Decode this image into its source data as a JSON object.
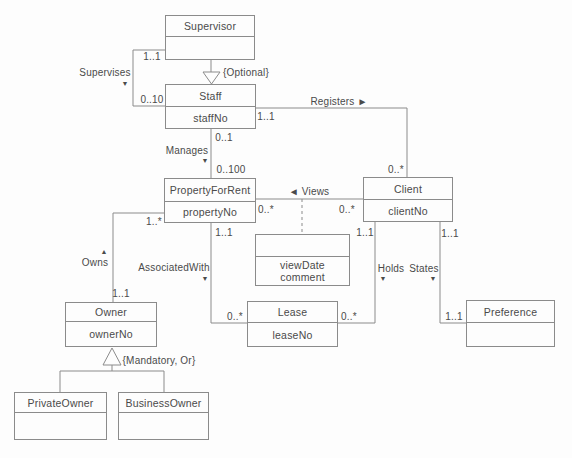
{
  "diagram": {
    "colors": {
      "background": "#fdfdfd",
      "box_fill": "#fdfdfd",
      "line": "#8b8b8b",
      "text": "#4a4a4a"
    },
    "classes": [
      {
        "id": "supervisor",
        "name": "Supervisor",
        "attributes": [],
        "x": 165,
        "y": 15,
        "w": 90,
        "h": 45,
        "divider_y": 37
      },
      {
        "id": "staff",
        "name": "Staff",
        "attributes": [
          "staffNo"
        ],
        "x": 165,
        "y": 84,
        "w": 91,
        "h": 45,
        "divider_y": 107
      },
      {
        "id": "property-for-rent",
        "name": "PropertyForRent",
        "attributes": [
          "propertyNo"
        ],
        "x": 164,
        "y": 178,
        "w": 92,
        "h": 45,
        "divider_y": 202
      },
      {
        "id": "client",
        "name": "Client",
        "attributes": [
          "clientNo"
        ],
        "x": 363,
        "y": 177,
        "w": 90,
        "h": 45,
        "divider_y": 200
      },
      {
        "id": "viewing",
        "name": "",
        "attributes": [
          "viewDate",
          "comment"
        ],
        "x": 255,
        "y": 234,
        "w": 95,
        "h": 52,
        "divider_y": 257
      },
      {
        "id": "owner",
        "name": "Owner",
        "attributes": [
          "ownerNo"
        ],
        "x": 65,
        "y": 302,
        "w": 92,
        "h": 45,
        "divider_y": 322
      },
      {
        "id": "lease",
        "name": "Lease",
        "attributes": [
          "leaseNo"
        ],
        "x": 247,
        "y": 301,
        "w": 91,
        "h": 46,
        "divider_y": 323
      },
      {
        "id": "preference",
        "name": "Preference",
        "attributes": [],
        "x": 466,
        "y": 300,
        "w": 89,
        "h": 47,
        "divider_y": 323
      },
      {
        "id": "private-owner",
        "name": "PrivateOwner",
        "attributes": [],
        "x": 14,
        "y": 392,
        "w": 93,
        "h": 48,
        "divider_y": 413
      },
      {
        "id": "business-owner",
        "name": "BusinessOwner",
        "attributes": [],
        "x": 118,
        "y": 392,
        "w": 91,
        "h": 48,
        "divider_y": 413
      }
    ],
    "edges": [
      {
        "id": "supervises-line",
        "points": [
          [
            165,
            50
          ],
          [
            133,
            50
          ],
          [
            133,
            106
          ],
          [
            165,
            106
          ]
        ],
        "dashed": false
      },
      {
        "id": "supervisor-generalization-stem",
        "points": [
          [
            211,
            60
          ],
          [
            211,
            72
          ]
        ],
        "dashed": false
      },
      {
        "id": "manages-line",
        "points": [
          [
            211,
            129
          ],
          [
            211,
            178
          ]
        ],
        "dashed": false
      },
      {
        "id": "registers-line",
        "points": [
          [
            256,
            108
          ],
          [
            407,
            108
          ],
          [
            407,
            177
          ]
        ],
        "dashed": false
      },
      {
        "id": "views-line",
        "points": [
          [
            256,
            199
          ],
          [
            363,
            199
          ]
        ],
        "dashed": false
      },
      {
        "id": "views-association-class-link",
        "points": [
          [
            302,
            199
          ],
          [
            302,
            234
          ]
        ],
        "dashed": true
      },
      {
        "id": "owns-line",
        "points": [
          [
            164,
            213
          ],
          [
            113,
            213
          ],
          [
            113,
            302
          ]
        ],
        "dashed": false
      },
      {
        "id": "associated-with-line",
        "points": [
          [
            211,
            223
          ],
          [
            211,
            323
          ],
          [
            247,
            323
          ]
        ],
        "dashed": false
      },
      {
        "id": "holds-line",
        "points": [
          [
            375,
            222
          ],
          [
            375,
            323
          ],
          [
            338,
            323
          ]
        ],
        "dashed": false
      },
      {
        "id": "states-line",
        "points": [
          [
            440,
            222
          ],
          [
            440,
            323
          ],
          [
            466,
            323
          ]
        ],
        "dashed": false
      },
      {
        "id": "owner-generalization-stem",
        "points": [
          [
            112,
            365
          ],
          [
            112,
            371
          ]
        ],
        "dashed": false
      },
      {
        "id": "owner-generalization-crossbar",
        "points": [
          [
            60,
            371
          ],
          [
            164,
            371
          ]
        ],
        "dashed": false
      },
      {
        "id": "owner-generalization-left-drop",
        "points": [
          [
            60,
            371
          ],
          [
            60,
            392
          ]
        ],
        "dashed": false
      },
      {
        "id": "owner-generalization-right-drop",
        "points": [
          [
            164,
            371
          ],
          [
            164,
            392
          ]
        ],
        "dashed": false
      }
    ],
    "generalization_triangles": [
      {
        "id": "staff-generalization-triangle",
        "points": [
          [
            203,
            72
          ],
          [
            220,
            72
          ],
          [
            211.5,
            84
          ]
        ]
      },
      {
        "id": "owner-generalization-triangle",
        "points": [
          [
            112,
            348
          ],
          [
            103,
            365
          ],
          [
            121,
            365
          ]
        ]
      }
    ],
    "labels": [
      {
        "id": "mult-supervises-supervisor",
        "text": "1..1",
        "x": 152,
        "y": 56,
        "size": 10
      },
      {
        "id": "assoc-supervises",
        "text": "Supervises",
        "x": 105,
        "y": 72,
        "size": 10
      },
      {
        "id": "arrow-supervises-down",
        "text": "▼",
        "x": 125,
        "y": 83,
        "size": 7
      },
      {
        "id": "mult-supervises-staff",
        "text": "0..10",
        "x": 152,
        "y": 99,
        "size": 10
      },
      {
        "id": "constraint-optional",
        "text": "{Optional}",
        "x": 246,
        "y": 72,
        "size": 10
      },
      {
        "id": "assoc-registers",
        "text": "Registers ►",
        "x": 339,
        "y": 101,
        "size": 10
      },
      {
        "id": "mult-registers-staff",
        "text": "1..1",
        "x": 266,
        "y": 116,
        "size": 10
      },
      {
        "id": "mult-manages-staff",
        "text": "0..1",
        "x": 224,
        "y": 137,
        "size": 10
      },
      {
        "id": "assoc-manages",
        "text": "Manages",
        "x": 187,
        "y": 150,
        "size": 10
      },
      {
        "id": "arrow-manages-down",
        "text": "▼",
        "x": 205,
        "y": 160,
        "size": 7
      },
      {
        "id": "mult-manages-property",
        "text": "0..100",
        "x": 231,
        "y": 169,
        "size": 10
      },
      {
        "id": "mult-registers-client",
        "text": "0..*",
        "x": 396,
        "y": 169,
        "size": 10
      },
      {
        "id": "assoc-views",
        "text": "◄ Views",
        "x": 309,
        "y": 191,
        "size": 10
      },
      {
        "id": "mult-views-property",
        "text": "0..*",
        "x": 266,
        "y": 209,
        "size": 10
      },
      {
        "id": "mult-views-client",
        "text": "0..*",
        "x": 347,
        "y": 209,
        "size": 10
      },
      {
        "id": "mult-owns-property",
        "text": "1..*",
        "x": 154,
        "y": 221,
        "size": 10
      },
      {
        "id": "arrow-owns-up",
        "text": "▲",
        "x": 104,
        "y": 251,
        "size": 7
      },
      {
        "id": "assoc-owns",
        "text": "Owns",
        "x": 95,
        "y": 262,
        "size": 10
      },
      {
        "id": "mult-owns-owner",
        "text": "1..1",
        "x": 121,
        "y": 293,
        "size": 10
      },
      {
        "id": "mult-associatedwith-property",
        "text": "1..1",
        "x": 224,
        "y": 232,
        "size": 10
      },
      {
        "id": "assoc-associatedwith",
        "text": "AssociatedWith",
        "x": 174,
        "y": 267,
        "size": 10
      },
      {
        "id": "arrow-associatedwith-down",
        "text": "▼",
        "x": 205,
        "y": 278,
        "size": 7
      },
      {
        "id": "mult-associatedwith-lease",
        "text": "0..*",
        "x": 235,
        "y": 316,
        "size": 10
      },
      {
        "id": "mult-holds-client",
        "text": "1..1",
        "x": 365,
        "y": 232,
        "size": 10
      },
      {
        "id": "assoc-holds",
        "text": "Holds",
        "x": 391,
        "y": 268,
        "size": 10
      },
      {
        "id": "arrow-holds-down",
        "text": "▼",
        "x": 383,
        "y": 278,
        "size": 7
      },
      {
        "id": "mult-holds-lease",
        "text": "0..*",
        "x": 349,
        "y": 316,
        "size": 10
      },
      {
        "id": "mult-states-client",
        "text": "1..1",
        "x": 450,
        "y": 233,
        "size": 10
      },
      {
        "id": "assoc-states",
        "text": "States",
        "x": 424,
        "y": 268,
        "size": 10
      },
      {
        "id": "arrow-states-down",
        "text": "▼",
        "x": 433,
        "y": 278,
        "size": 7
      },
      {
        "id": "mult-states-preference",
        "text": "1..1",
        "x": 454,
        "y": 316,
        "size": 10
      },
      {
        "id": "constraint-mandatory-or",
        "text": "{Mandatory, Or}",
        "x": 159,
        "y": 360,
        "size": 10
      }
    ]
  }
}
